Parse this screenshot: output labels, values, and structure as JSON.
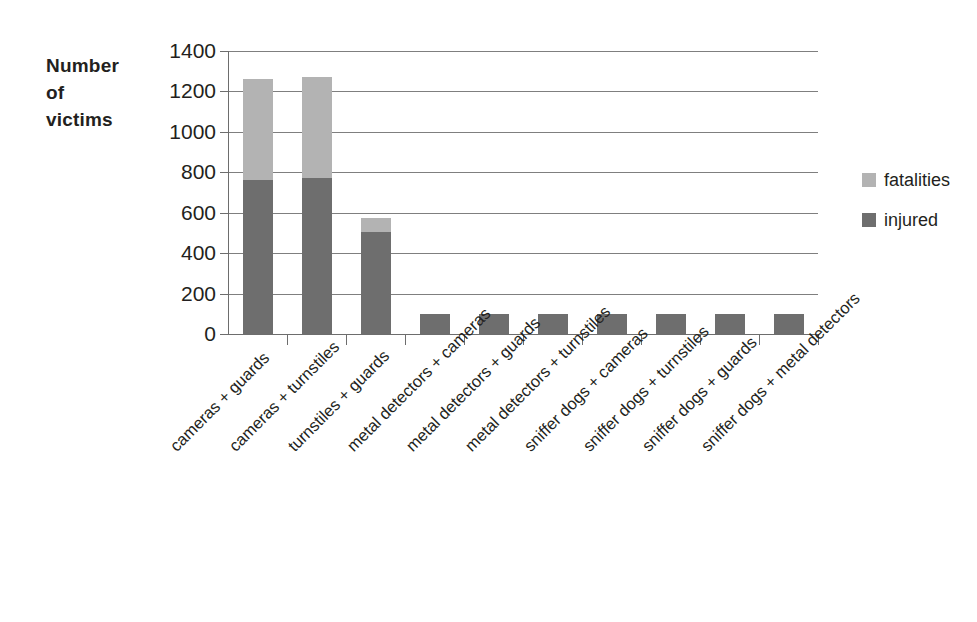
{
  "chart_data": {
    "type": "bar",
    "subtype": "stacked-vertical",
    "title": "",
    "xlabel": "",
    "ylabel": "Number of victims",
    "ylim": [
      0,
      1400
    ],
    "ytick_step": 200,
    "ytick_labels": [
      "1400",
      "1200",
      "1000",
      "800",
      "600",
      "400",
      "200",
      "0"
    ],
    "grid": "horizontal",
    "legend_position": "right",
    "categories": [
      "cameras + guards",
      "cameras + turnstiles",
      "turnstiles + guards",
      "metal detectors + cameras",
      "metal detectors + guards",
      "metal detectors + turnstiles",
      "sniffer dogs + cameras",
      "sniffer dogs + turnstiles",
      "sniffer dogs + guards",
      "sniffer dogs + metal detectors"
    ],
    "series": [
      {
        "name": "injured",
        "color": "#6e6e6e",
        "values": [
          760,
          770,
          505,
          100,
          100,
          100,
          100,
          100,
          100,
          100
        ]
      },
      {
        "name": "fatalities",
        "color": "#b3b3b3",
        "values": [
          500,
          500,
          70,
          0,
          0,
          0,
          0,
          0,
          0,
          0
        ]
      }
    ],
    "totals": [
      1260,
      1270,
      575,
      100,
      100,
      100,
      100,
      100,
      100,
      100
    ]
  },
  "axis": {
    "y_title_lines": [
      "Number",
      "of",
      "victims"
    ]
  },
  "legend": {
    "items": [
      {
        "label": "fatalities",
        "color": "#b3b3b3"
      },
      {
        "label": "injured",
        "color": "#6e6e6e"
      }
    ]
  }
}
